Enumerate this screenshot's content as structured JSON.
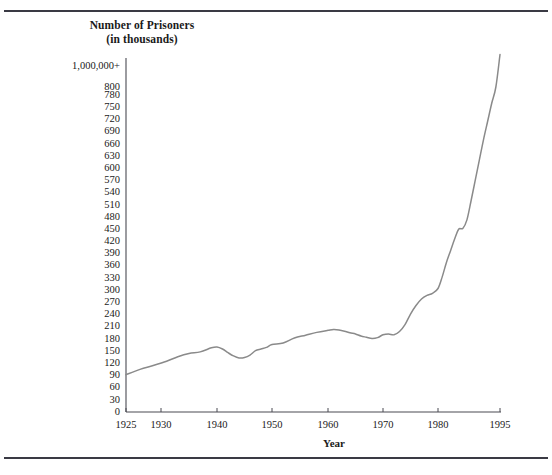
{
  "figure": {
    "title_line1": "Number of Prisoners",
    "title_line2": "(in thousands)",
    "xaxis_title": "Year",
    "line_color": "#8a8a8a",
    "axis_color": "#4a4a52",
    "rule_color": "#3a3a44"
  },
  "chart_data": {
    "type": "line",
    "title": "Number of Prisoners (in thousands)",
    "xlabel": "Year",
    "ylabel": "Number of Prisoners (in thousands)",
    "grid": false,
    "legend": "none",
    "xlim": [
      1925,
      1995
    ],
    "ylim": [
      0,
      800
    ],
    "xticks": [
      "1925",
      "1930",
      "1940",
      "1950",
      "1960",
      "1970",
      "1980",
      "1995"
    ],
    "xtick_values": [
      1925,
      1930,
      1940,
      1950,
      1960,
      1970,
      1980,
      1995
    ],
    "yticks": [
      "0",
      "30",
      "60",
      "90",
      "120",
      "150",
      "180",
      "210",
      "240",
      "270",
      "300",
      "330",
      "360",
      "390",
      "420",
      "450",
      "480",
      "510",
      "540",
      "570",
      "600",
      "630",
      "660",
      "690",
      "720",
      "750",
      "780",
      "800",
      "1,000,000+"
    ],
    "ytick_values": [
      0,
      30,
      60,
      90,
      120,
      150,
      180,
      210,
      240,
      270,
      300,
      330,
      360,
      390,
      420,
      450,
      480,
      510,
      540,
      570,
      600,
      630,
      660,
      690,
      720,
      750,
      780,
      800,
      1000
    ],
    "ytick_top_label": "1,000,000+",
    "series": [
      {
        "name": "Number of Prisoners",
        "x": [
          1925,
          1927,
          1929,
          1931,
          1933,
          1935,
          1937,
          1939,
          1940,
          1941,
          1942,
          1943,
          1944,
          1945,
          1946,
          1947,
          1948,
          1949,
          1950,
          1952,
          1954,
          1956,
          1958,
          1960,
          1961,
          1962,
          1963,
          1964,
          1965,
          1966,
          1967,
          1968,
          1969,
          1970,
          1971,
          1972,
          1973,
          1974,
          1975,
          1976,
          1977,
          1978,
          1979,
          1980,
          1981,
          1982,
          1983,
          1984,
          1985,
          1986,
          1987,
          1988,
          1989,
          1990,
          1991,
          1992,
          1993,
          1994,
          1995
        ],
        "y": [
          92,
          105,
          115,
          125,
          136,
          144,
          148,
          158,
          160,
          155,
          146,
          138,
          133,
          134,
          140,
          151,
          155,
          159,
          166,
          170,
          182,
          189,
          196,
          201,
          203,
          202,
          199,
          195,
          192,
          187,
          184,
          181,
          183,
          190,
          192,
          190,
          198,
          215,
          241,
          262,
          278,
          287,
          292,
          304,
          332,
          367,
          396,
          425,
          450,
          452,
          473,
          520,
          570,
          620,
          670,
          715,
          760,
          800,
          880
        ]
      }
    ]
  }
}
